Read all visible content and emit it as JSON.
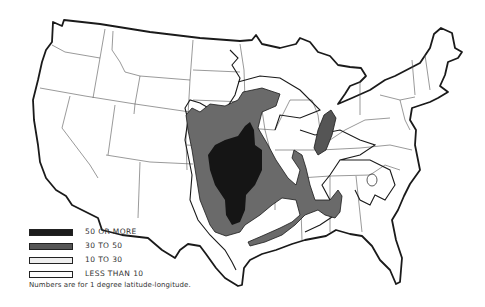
{
  "map": {
    "subject": "United States density map by 1 degree latitude-longitude",
    "legend": [
      {
        "label": "50 OR MORE",
        "fill": "#1c1c1c"
      },
      {
        "label": "30 TO 50",
        "fill": "#6a6a6a"
      },
      {
        "label": "10 TO 30",
        "fill": "#f2f2f2"
      },
      {
        "label": "LESS THAN 10",
        "fill": "#ffffff"
      }
    ],
    "footnote": "Numbers are for 1 degree latitude-longitude.",
    "colors": {
      "outline": "#1a1a1a",
      "state_line": "#444444",
      "class_50_plus": "#1c1c1c",
      "class_30_50": "#6a6a6a",
      "class_10_30": "#ffffff"
    }
  }
}
